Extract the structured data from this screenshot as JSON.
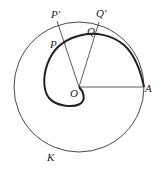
{
  "diagram": {
    "type": "archimedean-spiral-in-circle",
    "colors": {
      "stroke": "#333333",
      "background": "#ffffff"
    },
    "labels": {
      "O": "O",
      "A": "A",
      "P": "P",
      "Q": "Q",
      "P_prime": "P'",
      "Q_prime": "Q'",
      "K": "K"
    },
    "elements": [
      {
        "id": "circle-K",
        "kind": "circle",
        "center": "O",
        "passes_through": "A"
      },
      {
        "id": "spiral",
        "kind": "curve",
        "from": "O",
        "to": "A",
        "through": [
          "P",
          "Q"
        ]
      },
      {
        "id": "segment-OA",
        "kind": "line",
        "from": "O",
        "to": "A"
      },
      {
        "id": "segment-OP'",
        "kind": "line",
        "from": "O",
        "to": "P'",
        "through": "P"
      },
      {
        "id": "segment-OQ'",
        "kind": "line",
        "from": "O",
        "to": "Q'",
        "through": "Q"
      }
    ]
  }
}
